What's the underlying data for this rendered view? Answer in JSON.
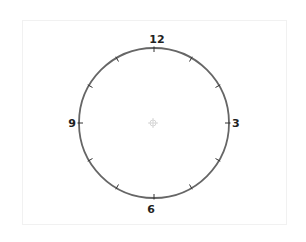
{
  "clock": {
    "labels": [
      {
        "hour": 12,
        "text": "12"
      },
      {
        "hour": 3,
        "text": "3"
      },
      {
        "hour": 6,
        "text": "6"
      },
      {
        "hour": 9,
        "text": "9"
      }
    ],
    "tick_count": 12,
    "center_marker_icon": "crosshair-icon",
    "colors": {
      "rim": "#666666",
      "ticks": "#333333",
      "labels": "#222222",
      "center_marker": "#d6d6d6",
      "frame_border": "#f1f1f1"
    }
  }
}
